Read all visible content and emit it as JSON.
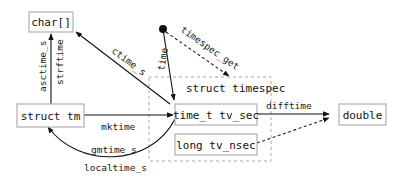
{
  "diagram": {
    "nodes": {
      "char_array": "char[]",
      "struct_tm": "struct tm",
      "time_t": "time_t tv_sec",
      "long_nsec": "long tv_nsec",
      "double": "double",
      "container_title": "struct timespec"
    },
    "edges": {
      "asctime_s": "asctime_s",
      "strftime": "strftime",
      "ctime_s": "ctime_s",
      "time": "time",
      "timespec_get": "timespec_get",
      "mktime": "mktime",
      "gmtime_s": "gmtime_s",
      "localtime_s": "localtime_s",
      "difftime": "difftime"
    }
  },
  "colors": {
    "stroke": "#111111",
    "box_border": "#b0b0b0",
    "container_border": "#a8a8a8"
  }
}
